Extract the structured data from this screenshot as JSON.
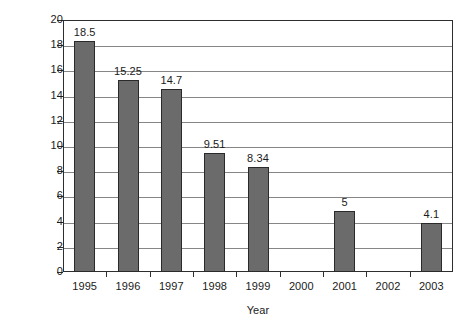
{
  "chart_data": {
    "type": "bar",
    "title": "",
    "xlabel": "Year",
    "ylabel": "Prevalence (%)",
    "categories": [
      "1995",
      "1996",
      "1997",
      "1998",
      "1999",
      "2000",
      "2001",
      "2002",
      "2003"
    ],
    "values": [
      18.5,
      15.25,
      14.7,
      9.51,
      8.34,
      null,
      5,
      null,
      4.1
    ],
    "value_labels": [
      "18.5",
      "15.25",
      "14.7",
      "9.51",
      "8.34",
      "",
      "5",
      "",
      "4.1"
    ],
    "bar_pixel_values": [
      18.35,
      15.25,
      14.5,
      9.45,
      8.3,
      null,
      4.85,
      null,
      3.9
    ],
    "ylim": [
      0,
      20
    ],
    "yticks": [
      0,
      2,
      4,
      6,
      8,
      10,
      12,
      14,
      16,
      18,
      20
    ],
    "ytick_labels": [
      "0",
      "2",
      "4",
      "6",
      "8",
      "10",
      "12",
      "14",
      "16",
      "18",
      "20"
    ],
    "grid": "horizontal",
    "legend": "none",
    "series_color": "#6b6b6b",
    "axis_color": "#2e2e2e",
    "gridline_color": "#868686",
    "background": "#ffffff"
  }
}
